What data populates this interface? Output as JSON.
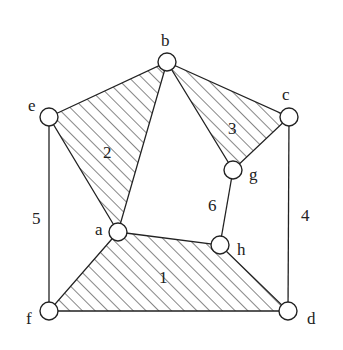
{
  "diagram": {
    "nodes": [
      {
        "id": "b",
        "x": 167,
        "y": 62,
        "lx": 161,
        "ly": 46
      },
      {
        "id": "e",
        "x": 49,
        "y": 117,
        "lx": 28,
        "ly": 111
      },
      {
        "id": "c",
        "x": 289,
        "y": 117,
        "lx": 282,
        "ly": 100
      },
      {
        "id": "g",
        "x": 233,
        "y": 170,
        "lx": 249,
        "ly": 180
      },
      {
        "id": "a",
        "x": 118,
        "y": 232,
        "lx": 95,
        "ly": 235
      },
      {
        "id": "h",
        "x": 220,
        "y": 245,
        "lx": 237,
        "ly": 255
      },
      {
        "id": "f",
        "x": 49,
        "y": 311,
        "lx": 26,
        "ly": 324
      },
      {
        "id": "d",
        "x": 288,
        "y": 311,
        "lx": 307,
        "ly": 324
      }
    ],
    "edges": [
      {
        "from": "e",
        "to": "f",
        "label": "5",
        "lx": 32,
        "ly": 224
      },
      {
        "from": "c",
        "to": "d",
        "label": "4",
        "lx": 301,
        "ly": 221
      },
      {
        "from": "g",
        "to": "h",
        "label": "6",
        "lx": 208,
        "ly": 211
      }
    ],
    "faces": [
      {
        "id": "2",
        "label": "2",
        "vertices": [
          "e",
          "b",
          "a"
        ],
        "lx": 103,
        "ly": 158
      },
      {
        "id": "3",
        "label": "3",
        "vertices": [
          "b",
          "c",
          "g"
        ],
        "lx": 228,
        "ly": 134
      },
      {
        "id": "1",
        "label": "1",
        "vertices": [
          "a",
          "h",
          "d",
          "f"
        ],
        "lx": 159,
        "ly": 283
      }
    ]
  }
}
